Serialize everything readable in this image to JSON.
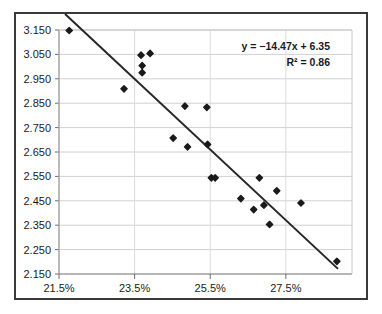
{
  "chart_data": {
    "type": "scatter",
    "title": "",
    "xlabel": "",
    "ylabel": "",
    "xlim": [
      0.215,
      0.2925
    ],
    "ylim": [
      2.15,
      3.15
    ],
    "grid": true,
    "grid_axis": "y",
    "legend": false,
    "xtick_labels": [
      "21.5%",
      "23.5%",
      "25.5%",
      "27.5%"
    ],
    "xtick_values": [
      0.215,
      0.235,
      0.255,
      0.275
    ],
    "ytick_labels": [
      "2.150",
      "2.250",
      "2.350",
      "2.450",
      "2.550",
      "2.650",
      "2.750",
      "2.850",
      "2.950",
      "3.050",
      "3.150"
    ],
    "ytick_values": [
      2.15,
      2.25,
      2.35,
      2.45,
      2.55,
      2.65,
      2.75,
      2.85,
      2.95,
      3.05,
      3.15
    ],
    "marker": "diamond",
    "marker_color": "#1a1a1a",
    "points": [
      {
        "x": 0.2177,
        "y": 3.148
      },
      {
        "x": 0.2322,
        "y": 2.909
      },
      {
        "x": 0.2367,
        "y": 3.047
      },
      {
        "x": 0.2391,
        "y": 3.054
      },
      {
        "x": 0.237,
        "y": 3.004
      },
      {
        "x": 0.237,
        "y": 2.975
      },
      {
        "x": 0.2452,
        "y": 2.707
      },
      {
        "x": 0.2483,
        "y": 2.838
      },
      {
        "x": 0.249,
        "y": 2.671
      },
      {
        "x": 0.2541,
        "y": 2.833
      },
      {
        "x": 0.2543,
        "y": 2.681
      },
      {
        "x": 0.2553,
        "y": 2.544
      },
      {
        "x": 0.2563,
        "y": 2.544
      },
      {
        "x": 0.2631,
        "y": 2.459
      },
      {
        "x": 0.2665,
        "y": 2.414
      },
      {
        "x": 0.268,
        "y": 2.544
      },
      {
        "x": 0.2692,
        "y": 2.432
      },
      {
        "x": 0.2707,
        "y": 2.353
      },
      {
        "x": 0.2726,
        "y": 2.491
      },
      {
        "x": 0.279,
        "y": 2.441
      },
      {
        "x": 0.2885,
        "y": 2.202
      }
    ],
    "trendline": {
      "slope": -14.47,
      "intercept": 6.35,
      "r_squared": 0.86,
      "color": "#262626",
      "x_start": 0.2166,
      "x_end": 0.2888
    },
    "annotation": {
      "equation": "y = −14.47x + 6.35",
      "r_squared_label": "R² = 0.86"
    }
  }
}
